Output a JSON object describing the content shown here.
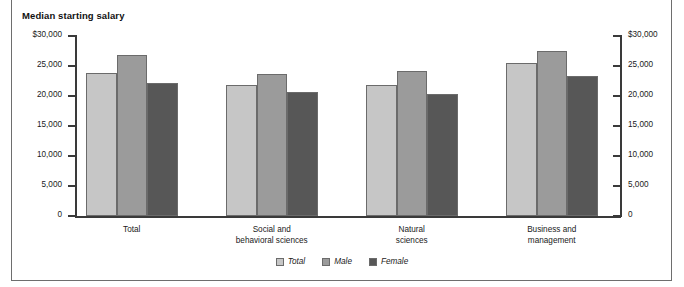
{
  "chart_data": {
    "type": "bar",
    "title": "Median starting salary",
    "xlabel": "",
    "ylabel": "Median starting salary",
    "ylim": [
      0,
      30000
    ],
    "grid": false,
    "legend_position": "bottom-center",
    "dual_axis": true,
    "categories": [
      "Total",
      "Social and\nbehavioral sciences",
      "Natural\nsciences",
      "Business and\nmanagement"
    ],
    "category_lines": [
      [
        "Total"
      ],
      [
        "Social and",
        "behavioral sciences"
      ],
      [
        "Natural",
        "sciences"
      ],
      [
        "Business and",
        "management"
      ]
    ],
    "series": [
      {
        "name": "Total",
        "color": "#c6c6c6",
        "values": [
          23800,
          21800,
          21900,
          25500
        ]
      },
      {
        "name": "Male",
        "color": "#9b9b9b",
        "values": [
          26800,
          23700,
          24100,
          27500
        ]
      },
      {
        "name": "Female",
        "color": "#575757",
        "values": [
          22100,
          20600,
          20300,
          23300
        ]
      }
    ],
    "y_ticks": [
      {
        "value": 30000,
        "label": "$30,000"
      },
      {
        "value": 25000,
        "label": "25,000"
      },
      {
        "value": 20000,
        "label": "20,000"
      },
      {
        "value": 15000,
        "label": "15,000"
      },
      {
        "value": 10000,
        "label": "10,000"
      },
      {
        "value": 5000,
        "label": "5,000"
      },
      {
        "value": 0,
        "label": "0"
      }
    ],
    "y_ticks_right": [
      {
        "value": 30000,
        "label": "$30,000"
      },
      {
        "value": 25000,
        "label": "25,000"
      },
      {
        "value": 20000,
        "label": "20,000"
      },
      {
        "value": 15000,
        "label": "15,000"
      },
      {
        "value": 10000,
        "label": "10,000"
      },
      {
        "value": 5000,
        "label": "5,000"
      },
      {
        "value": 0,
        "label": "0"
      }
    ]
  },
  "colors": {
    "total": "#c6c6c6",
    "male": "#9b9b9b",
    "female": "#575757",
    "axis": "#3a3a3a",
    "frame": "#6e6e6e",
    "bar_outline": "#6b6b6b",
    "text": "#1a1a1a"
  }
}
